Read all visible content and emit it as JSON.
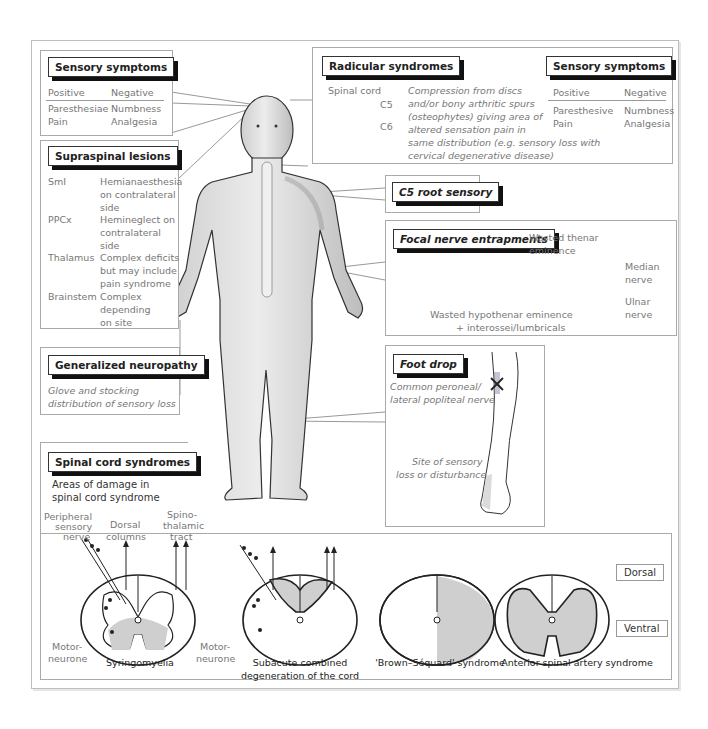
{
  "sensory_symptoms_left": {
    "title": "Sensory symptoms",
    "col_positive": "Positive",
    "col_negative": "Negative",
    "rows": [
      {
        "positive": "Paresthesiae",
        "negative": "Numbness"
      },
      {
        "positive": "Pain",
        "negative": "Analgesia"
      }
    ]
  },
  "supraspinal_lesions": {
    "title": "Supraspinal lesions",
    "rows": [
      {
        "site": "SmI",
        "l1": "Hemianaesthesia",
        "l2": "on contralateral",
        "l3": "side"
      },
      {
        "site": "PPCx",
        "l1": "Hemineglect on",
        "l2": "contralateral",
        "l3": "side"
      },
      {
        "site": "Thalamus",
        "l1": "Complex deficits",
        "l2": "but may include",
        "l3": "pain syndrome"
      },
      {
        "site": "Brainstem",
        "l1": "Complex",
        "l2": "depending",
        "l3": "on site"
      }
    ]
  },
  "generalized_neuropathy": {
    "title": "Generalized neuropathy",
    "line1": "Glove and stocking",
    "line2": "distribution of sensory loss"
  },
  "radicular_syndromes": {
    "title": "Radicular syndromes",
    "spinal_cord_label": "Spinal cord",
    "c5": "C5",
    "c6": "C6",
    "description": [
      "Compression from discs",
      "and/or bony arthritic spurs",
      "(osteophytes) giving area of",
      "altered sensation  pain in",
      "same distribution (e.g. sensory loss with",
      "cervical degenerative disease)"
    ]
  },
  "sensory_symptoms_right": {
    "title": "Sensory symptoms",
    "col_positive": "Positive",
    "col_negative": "Negative",
    "rows": [
      {
        "positive": "Paresthesive",
        "negative": "Numbness"
      },
      {
        "positive": "Pain",
        "negative": "Analgesia"
      }
    ]
  },
  "c5_root": {
    "title": "C5 root sensory"
  },
  "focal_nerve": {
    "title": "Focal nerve entrapments",
    "thenar1": "Wasted thenar",
    "thenar2": "eminence",
    "median1": "Median",
    "median2": "nerve",
    "ulnar1": "Ulnar",
    "ulnar2": "nerve",
    "hypothenar1": "Wasted hypothenar eminence",
    "hypothenar2": "+ interossei/lumbricals"
  },
  "foot_drop": {
    "title": "Foot drop",
    "nerve1": "Common peroneal/",
    "nerve2": "lateral popliteal nerve",
    "site1": "Site of sensory",
    "site2": "loss or disturbance"
  },
  "spinal_cord_syndromes": {
    "title": "Spinal cord syndromes",
    "subtitle1": "Areas of damage in",
    "subtitle2": "spinal cord syndrome",
    "peripheral1": "Peripheral",
    "peripheral2": "sensory",
    "peripheral3": "nerve",
    "dorsal1": "Dorsal",
    "dorsal2": "columns",
    "spino1": "Spino-",
    "spino2": "thalamic",
    "spino3": "tract",
    "motor1": "Motor-",
    "motor2": "neurone",
    "syndromes": [
      {
        "l1": "Syringomyelia",
        "l2": ""
      },
      {
        "l1": "Subacute combined",
        "l2": "degeneration of the cord"
      },
      {
        "l1": "'Brown–Séquard' syndrome",
        "l2": ""
      },
      {
        "l1": "Anterior spinal artery syndrome",
        "l2": ""
      }
    ],
    "dorsal_label": "Dorsal",
    "ventral_label": "Ventral"
  },
  "colors": {
    "shade": "#cfcfcf",
    "ink": "#222222",
    "text": "#777777",
    "marker": "#8a7aa0"
  }
}
